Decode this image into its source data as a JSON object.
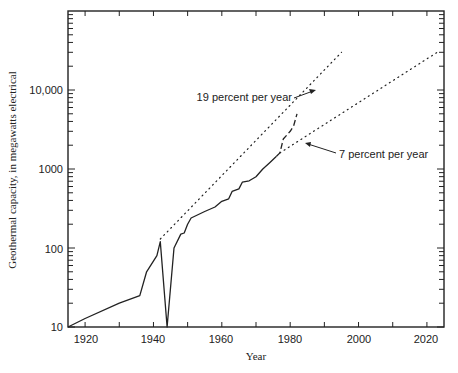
{
  "chart_data": {
    "type": "line",
    "title": "",
    "xlabel": "Year",
    "ylabel": "Geothermal capacity, in megawatts electrical",
    "xlim": [
      1915,
      2025
    ],
    "ylim": [
      10,
      100000
    ],
    "yscale": "log",
    "grid": false,
    "x_ticks": [
      1920,
      1940,
      1960,
      1980,
      2000,
      2020
    ],
    "x_tick_labels": [
      "1920",
      "1940",
      "1960",
      "1980",
      "2000",
      "2020"
    ],
    "y_ticks": [
      10,
      100,
      1000,
      10000
    ],
    "y_tick_labels": [
      "10",
      "100",
      "1000",
      "10,000"
    ],
    "series": [
      {
        "name": "Installed capacity (historical)",
        "style": "solid",
        "x": [
          1915,
          1920,
          1930,
          1936,
          1938,
          1941,
          1942,
          1944,
          1946,
          1948,
          1949,
          1950,
          1951,
          1955,
          1958,
          1960,
          1962,
          1963,
          1965,
          1966,
          1968,
          1970,
          1972,
          1974,
          1976
        ],
        "y": [
          10,
          12.8,
          20,
          25,
          50,
          80,
          120,
          10,
          100,
          150,
          155,
          200,
          240,
          290,
          330,
          390,
          420,
          520,
          560,
          680,
          710,
          800,
          1000,
          1200,
          1450
        ]
      },
      {
        "name": "Installed/planned capacity",
        "style": "dashed",
        "x": [
          1976,
          1977,
          1978,
          1980,
          1981,
          1982
        ],
        "y": [
          1450,
          1600,
          2400,
          3000,
          3500,
          5000
        ]
      },
      {
        "name": "19 percent per year",
        "style": "dotted",
        "x": [
          1942,
          1995
        ],
        "y": [
          130,
          30000
        ]
      },
      {
        "name": "7 percent per year",
        "style": "dotted",
        "x": [
          1977,
          2023
        ],
        "y": [
          1600,
          30000
        ]
      }
    ],
    "annotations": [
      {
        "text": "19 percent per year",
        "arrow_to": [
          1988,
          10000
        ]
      },
      {
        "text": "7 percent per year",
        "arrow_to": [
          1982,
          2100
        ]
      }
    ],
    "legend": "none"
  },
  "labels": {
    "xlabel": "Year",
    "ylabel": "Geothermal capacity, in megawatts electrical",
    "annot_19": "19 percent per year",
    "annot_7": "7 percent per year",
    "x_ticks": [
      "1920",
      "1940",
      "1960",
      "1980",
      "2000",
      "2020"
    ],
    "y_ticks": [
      "10",
      "100",
      "1000",
      "10,000"
    ]
  }
}
